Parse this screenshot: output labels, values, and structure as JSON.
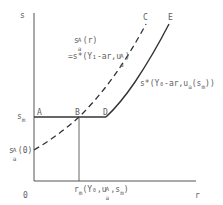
{
  "axes": {
    "y_label": "s",
    "x_label": "r",
    "origin_label": "0"
  },
  "points": {
    "A": "A",
    "B": "B",
    "C": "C",
    "D": "D",
    "E": "E"
  },
  "labels": {
    "s_m": "s",
    "s_m_sub": "m",
    "s_a0": "s",
    "s_a0_sup": "A",
    "s_a0_sub": "a",
    "s_a0_arg": "(0)",
    "dashed_curve_line1_main": "s",
    "dashed_curve_line1_sup": "A",
    "dashed_curve_line1_sub": "a",
    "dashed_curve_line1_arg": "(r)",
    "dashed_curve_line2": "=s*(Y₁-ar,u",
    "dashed_curve_line2_sup": "A",
    "dashed_curve_line2_sub": "a",
    "dashed_curve_line2_end": ")",
    "solid_curve_main": "s*(Y₀-ar,u",
    "solid_curve_sub": "a",
    "solid_curve_arg": "(s",
    "solid_curve_arg_sub": "m",
    "solid_curve_end": "))",
    "r_m_main": "r",
    "r_m_sub": "m",
    "r_m_arg": "(Y₀,u",
    "r_m_arg_sup": "A",
    "r_m_arg_sub": "a",
    "r_m_arg_mid": ",s",
    "r_m_arg_sub2": "m",
    "r_m_arg_end": ")"
  },
  "colors": {
    "line": "#4a4a4a",
    "text": "#606060"
  }
}
